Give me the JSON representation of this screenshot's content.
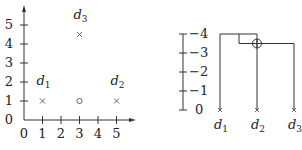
{
  "scatter": {
    "x_ticks": [
      "0",
      "1",
      "2",
      "3",
      "4",
      "5"
    ],
    "y_ticks": [
      "0",
      "1",
      "2",
      "3",
      "4",
      "5"
    ],
    "points": [
      {
        "label": "d",
        "sub": "1",
        "x": 1,
        "y": 1,
        "marker": "cross"
      },
      {
        "label": "d",
        "sub": "2",
        "x": 5,
        "y": 1,
        "marker": "cross"
      },
      {
        "label": "d",
        "sub": "3",
        "x": 3,
        "y": 4.5,
        "marker": "cross"
      },
      {
        "label": "",
        "sub": "",
        "x": 3,
        "y": 1,
        "marker": "circle"
      }
    ]
  },
  "dendrogram": {
    "y_ticks": [
      "0",
      "−1",
      "−2",
      "−3",
      "−4"
    ],
    "leaves": [
      {
        "label": "d",
        "sub": "1"
      },
      {
        "label": "d",
        "sub": "2"
      },
      {
        "label": "d",
        "sub": "3"
      }
    ],
    "merges": [
      {
        "children": [
          "d2",
          "d3"
        ],
        "height": -3.5,
        "marker": "circle-plus"
      },
      {
        "children": [
          "d1",
          "d2d3"
        ],
        "height": -4
      }
    ]
  }
}
